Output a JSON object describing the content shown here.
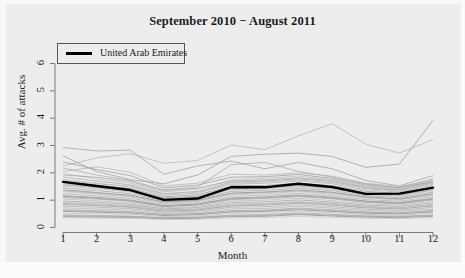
{
  "chart_data": {
    "type": "line",
    "title": "September 2010 − August 2011",
    "xlabel": "Month",
    "ylabel": "Avg. # of attacks",
    "xlim": [
      1,
      12
    ],
    "ylim": [
      0,
      6.4
    ],
    "xticks": [
      "1",
      "2",
      "3",
      "4",
      "5",
      "6",
      "7",
      "8",
      "9",
      "10",
      "11",
      "12"
    ],
    "yticks": [
      "0",
      "1",
      "2",
      "3",
      "4",
      "5",
      "6"
    ],
    "grid": false,
    "legend": {
      "position": "top-left",
      "entries": [
        {
          "name": "United Arab Emirates",
          "color": "#000000",
          "linewidth": "bold"
        }
      ]
    },
    "x": [
      1,
      2,
      3,
      4,
      5,
      6,
      7,
      8,
      9,
      10,
      11,
      12
    ],
    "highlight_series": {
      "name": "United Arab Emirates",
      "color": "#000000",
      "values": [
        1.67,
        1.52,
        1.37,
        1.01,
        1.06,
        1.48,
        1.47,
        1.6,
        1.48,
        1.23,
        1.24,
        1.46
      ]
    },
    "background_series": [
      {
        "name": "bg-01",
        "values": [
          2.93,
          2.8,
          2.83,
          1.95,
          2.25,
          2.43,
          2.15,
          2.38,
          2.15,
          1.72,
          1.52,
          1.9
        ]
      },
      {
        "name": "bg-02",
        "values": [
          2.25,
          2.55,
          2.7,
          2.35,
          2.45,
          3.02,
          2.85,
          3.35,
          3.8,
          3.05,
          2.72,
          3.22
        ]
      },
      {
        "name": "bg-03",
        "values": [
          2.62,
          2.05,
          1.75,
          1.6,
          1.92,
          2.6,
          2.68,
          2.72,
          2.6,
          2.2,
          2.32,
          3.92
        ]
      },
      {
        "name": "bg-04",
        "values": [
          2.18,
          1.92,
          1.72,
          1.38,
          1.48,
          2.3,
          2.38,
          2.05,
          1.85,
          1.6,
          1.45,
          1.78
        ]
      },
      {
        "name": "bg-05",
        "values": [
          1.98,
          1.78,
          1.62,
          1.3,
          1.4,
          1.74,
          1.8,
          1.88,
          1.76,
          1.52,
          1.42,
          1.7
        ]
      },
      {
        "name": "bg-06",
        "values": [
          1.85,
          1.7,
          1.56,
          1.24,
          1.32,
          1.66,
          1.7,
          1.78,
          1.68,
          1.45,
          1.36,
          1.62
        ]
      },
      {
        "name": "bg-07",
        "values": [
          1.76,
          1.62,
          1.48,
          1.18,
          1.26,
          1.58,
          1.62,
          1.7,
          1.6,
          1.38,
          1.3,
          1.55
        ]
      },
      {
        "name": "bg-08",
        "values": [
          1.68,
          1.55,
          1.42,
          1.12,
          1.2,
          1.5,
          1.54,
          1.62,
          1.53,
          1.32,
          1.25,
          1.48
        ]
      },
      {
        "name": "bg-09",
        "values": [
          1.6,
          1.48,
          1.36,
          1.08,
          1.15,
          1.44,
          1.48,
          1.56,
          1.47,
          1.27,
          1.2,
          1.42
        ]
      },
      {
        "name": "bg-10",
        "values": [
          1.52,
          1.42,
          1.3,
          1.03,
          1.1,
          1.38,
          1.42,
          1.49,
          1.41,
          1.22,
          1.15,
          1.36
        ]
      },
      {
        "name": "bg-11",
        "values": [
          1.45,
          1.35,
          1.24,
          0.98,
          1.05,
          1.32,
          1.36,
          1.43,
          1.35,
          1.17,
          1.1,
          1.3
        ]
      },
      {
        "name": "bg-12",
        "values": [
          1.38,
          1.28,
          1.18,
          0.94,
          1.0,
          1.26,
          1.3,
          1.37,
          1.29,
          1.12,
          1.05,
          1.24
        ]
      },
      {
        "name": "bg-13",
        "values": [
          1.31,
          1.22,
          1.12,
          0.89,
          0.95,
          1.2,
          1.24,
          1.31,
          1.23,
          1.07,
          1.0,
          1.18
        ]
      },
      {
        "name": "bg-14",
        "values": [
          1.24,
          1.16,
          1.07,
          0.85,
          0.91,
          1.14,
          1.18,
          1.25,
          1.17,
          1.02,
          0.96,
          1.13
        ]
      },
      {
        "name": "bg-15",
        "values": [
          1.17,
          1.1,
          1.01,
          0.8,
          0.86,
          1.08,
          1.12,
          1.19,
          1.11,
          0.97,
          0.91,
          1.07
        ]
      },
      {
        "name": "bg-16",
        "values": [
          1.1,
          1.04,
          0.96,
          0.76,
          0.82,
          1.02,
          1.06,
          1.13,
          1.05,
          0.92,
          0.86,
          1.01
        ]
      },
      {
        "name": "bg-17",
        "values": [
          1.04,
          0.98,
          0.9,
          0.72,
          0.77,
          0.97,
          1.0,
          1.07,
          0.99,
          0.87,
          0.82,
          0.96
        ]
      },
      {
        "name": "bg-18",
        "values": [
          0.97,
          0.92,
          0.85,
          0.68,
          0.73,
          0.91,
          0.94,
          1.01,
          0.93,
          0.82,
          0.77,
          0.9
        ]
      },
      {
        "name": "bg-19",
        "values": [
          0.91,
          0.86,
          0.8,
          0.64,
          0.68,
          0.85,
          0.88,
          0.95,
          0.88,
          0.77,
          0.72,
          0.85
        ]
      },
      {
        "name": "bg-20",
        "values": [
          0.84,
          0.8,
          0.74,
          0.6,
          0.64,
          0.79,
          0.82,
          0.89,
          0.82,
          0.72,
          0.68,
          0.79
        ]
      },
      {
        "name": "bg-21",
        "values": [
          0.78,
          0.74,
          0.69,
          0.56,
          0.6,
          0.74,
          0.76,
          0.83,
          0.76,
          0.67,
          0.63,
          0.74
        ]
      },
      {
        "name": "bg-22",
        "values": [
          0.72,
          0.68,
          0.64,
          0.52,
          0.55,
          0.68,
          0.7,
          0.77,
          0.71,
          0.62,
          0.59,
          0.68
        ]
      },
      {
        "name": "bg-23",
        "values": [
          0.65,
          0.62,
          0.58,
          0.48,
          0.51,
          0.62,
          0.64,
          0.71,
          0.65,
          0.57,
          0.54,
          0.63
        ]
      },
      {
        "name": "bg-24",
        "values": [
          0.59,
          0.56,
          0.53,
          0.44,
          0.47,
          0.57,
          0.59,
          0.65,
          0.59,
          0.52,
          0.5,
          0.57
        ]
      },
      {
        "name": "bg-25",
        "values": [
          0.52,
          0.5,
          0.48,
          0.4,
          0.42,
          0.51,
          0.53,
          0.59,
          0.54,
          0.48,
          0.45,
          0.52
        ]
      },
      {
        "name": "bg-26",
        "values": [
          0.46,
          0.44,
          0.42,
          0.36,
          0.38,
          0.45,
          0.47,
          0.53,
          0.48,
          0.43,
          0.41,
          0.46
        ]
      },
      {
        "name": "bg-27",
        "values": [
          0.4,
          0.38,
          0.37,
          0.32,
          0.34,
          0.4,
          0.41,
          0.47,
          0.42,
          0.38,
          0.36,
          0.41
        ]
      },
      {
        "name": "bg-28",
        "values": [
          0.36,
          0.34,
          0.33,
          0.29,
          0.3,
          0.35,
          0.36,
          0.41,
          0.37,
          0.34,
          0.32,
          0.36
        ]
      },
      {
        "name": "bg-29",
        "values": [
          2.05,
          2.22,
          2.02,
          1.52,
          1.62,
          1.95,
          1.92,
          2.0,
          1.88,
          1.62,
          1.5,
          1.74
        ]
      },
      {
        "name": "bg-30",
        "values": [
          2.4,
          2.12,
          1.9,
          1.45,
          1.55,
          1.84,
          1.86,
          1.94,
          1.8,
          1.56,
          1.46,
          1.68
        ]
      },
      {
        "name": "bg-31",
        "values": [
          1.92,
          1.84,
          1.68,
          1.34,
          1.44,
          1.7,
          1.74,
          1.82,
          1.72,
          1.48,
          1.39,
          1.66
        ]
      },
      {
        "name": "bg-32",
        "values": [
          1.72,
          1.6,
          1.52,
          1.22,
          1.29,
          1.62,
          1.66,
          1.74,
          1.64,
          1.42,
          1.33,
          1.58
        ]
      },
      {
        "name": "bg-33",
        "values": [
          1.56,
          1.46,
          1.34,
          1.06,
          1.13,
          1.41,
          1.45,
          1.52,
          1.44,
          1.25,
          1.18,
          1.39
        ]
      },
      {
        "name": "bg-34",
        "values": [
          1.34,
          1.25,
          1.15,
          0.92,
          0.98,
          1.23,
          1.27,
          1.34,
          1.26,
          1.1,
          1.03,
          1.21
        ]
      },
      {
        "name": "bg-35",
        "values": [
          1.13,
          1.07,
          0.98,
          0.78,
          0.84,
          1.05,
          1.09,
          1.16,
          1.08,
          0.95,
          0.89,
          1.04
        ]
      },
      {
        "name": "bg-36",
        "values": [
          0.88,
          0.83,
          0.77,
          0.62,
          0.66,
          0.82,
          0.85,
          0.92,
          0.85,
          0.75,
          0.7,
          0.82
        ]
      },
      {
        "name": "bg-37",
        "values": [
          0.62,
          0.59,
          0.56,
          0.46,
          0.49,
          0.59,
          0.61,
          0.68,
          0.62,
          0.55,
          0.52,
          0.6
        ]
      },
      {
        "name": "bg-38",
        "values": [
          0.43,
          0.41,
          0.4,
          0.34,
          0.36,
          0.43,
          0.44,
          0.5,
          0.45,
          0.41,
          0.39,
          0.44
        ]
      }
    ]
  },
  "chart": {
    "title": "September 2010 − August 2011",
    "xlabel": "Month",
    "ylabel": "Avg. # of attacks",
    "legend_label": "United Arab Emirates"
  }
}
